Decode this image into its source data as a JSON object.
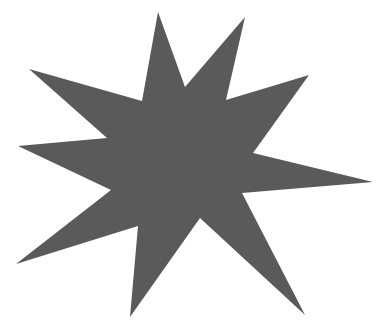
{
  "canvas": {
    "width": 386,
    "height": 335,
    "background": "#ffffff"
  },
  "shape": {
    "type": "nine-point-star",
    "fill": "#5a5a5a",
    "points": "158,12 185,87 245,17 226,100 309,75 253,153 373,182 242,193 305,315 200,218 130,317 138,226 16,264 111,190 18,146 107,138 29,69 142,101"
  }
}
